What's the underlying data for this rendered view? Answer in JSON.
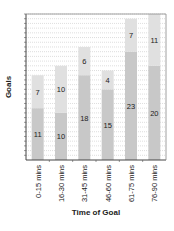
{
  "chart_data": {
    "type": "bar",
    "stacked": true,
    "title": "",
    "xlabel": "Time of Goal",
    "ylabel": "Goals",
    "categories": [
      "0-15 mins",
      "16-30 mins",
      "31-45 mins",
      "46-60 mins",
      "61-75 mins",
      "76-90 mins"
    ],
    "series": [
      {
        "name": "Lower segment",
        "values": [
          11,
          10,
          18,
          15,
          23,
          20
        ],
        "color": "#c8c8c8"
      },
      {
        "name": "Upper segment",
        "values": [
          7,
          10,
          6,
          4,
          7,
          11
        ],
        "color": "#e0e0e0"
      }
    ],
    "totals": [
      18,
      20,
      24,
      19,
      30,
      31
    ],
    "ylim": [
      0,
      31
    ],
    "grid": true,
    "legend": "none"
  }
}
